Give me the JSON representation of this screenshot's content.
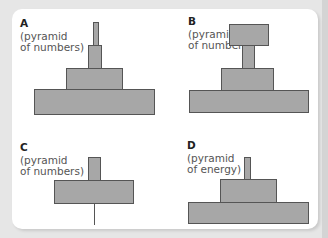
{
  "colors": {
    "background": "#e6e6e6",
    "panel": "#ffffff",
    "bar_fill": "#a7a7a7",
    "bar_outline": "#555555"
  },
  "diagrams": [
    {
      "letter": "A",
      "line1": "(pyramid",
      "line2": "of numbers)"
    },
    {
      "letter": "B",
      "line1": "(pyramid",
      "line2": "of numbers)"
    },
    {
      "letter": "C",
      "line1": "(pyramid",
      "line2": "of numbers)"
    },
    {
      "letter": "D",
      "line1": "(pyramid",
      "line2": "of energy)"
    }
  ]
}
